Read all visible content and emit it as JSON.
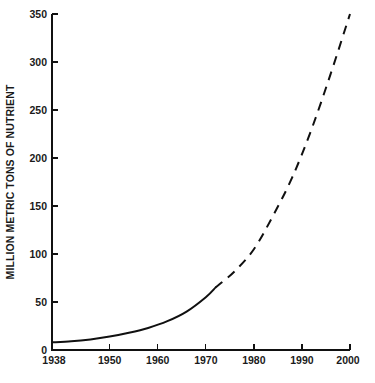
{
  "chart_data": {
    "type": "line",
    "title": "",
    "subtitle": "",
    "xlabel": "",
    "ylabel": "MILLION METRIC TONS OF NUTRIENT",
    "xlim": [
      1938,
      2000
    ],
    "ylim": [
      0,
      350
    ],
    "grid": false,
    "legend": null,
    "x_ticks": [
      1938,
      1950,
      1960,
      1970,
      1980,
      1990,
      2000
    ],
    "x_tick_labels": [
      "1938",
      "1950",
      "1960",
      "1970",
      "1980",
      "1990",
      "2000"
    ],
    "y_ticks": [
      0,
      50,
      100,
      150,
      200,
      250,
      300,
      350
    ],
    "y_tick_labels": [
      "0",
      "50",
      "100",
      "150",
      "200",
      "250",
      "300",
      "350"
    ],
    "annotations": [],
    "series": [
      {
        "name": "Historical (actual)",
        "style": "solid",
        "x": [
          1938,
          1942,
          1946,
          1950,
          1954,
          1958,
          1962,
          1966,
          1970,
          1972
        ],
        "values": [
          8,
          9,
          11,
          14,
          18,
          23,
          30,
          40,
          55,
          65
        ]
      },
      {
        "name": "Projected",
        "style": "dashed",
        "x": [
          1972,
          1976,
          1980,
          1984,
          1988,
          1992,
          1996,
          2000
        ],
        "values": [
          65,
          82,
          105,
          140,
          180,
          230,
          288,
          350
        ]
      }
    ]
  },
  "geometry": {
    "plot_left": 52,
    "plot_right": 350,
    "plot_top": 14,
    "plot_bottom": 350
  }
}
